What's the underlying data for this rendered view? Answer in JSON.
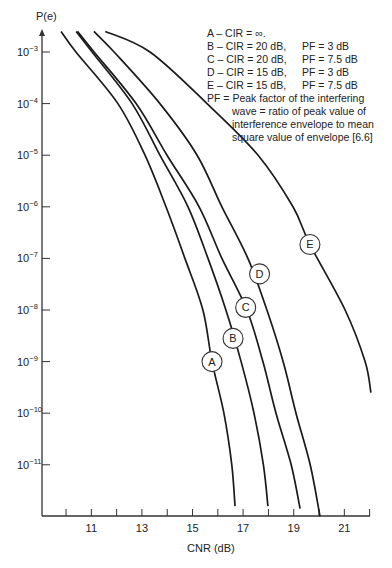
{
  "chart_data": {
    "type": "line",
    "title": "",
    "xlabel": "CNR (dB)",
    "ylabel": "P(e)",
    "y_scale": "log",
    "xlim": [
      9.05,
      22.1
    ],
    "ylim_exponent": [
      -12,
      -2.6
    ],
    "x_ticks": [
      10,
      11,
      12,
      13,
      14,
      15,
      16,
      17,
      18,
      19,
      20,
      21,
      22
    ],
    "x_tick_labels": [
      "11",
      "13",
      "15",
      "17",
      "19",
      "21"
    ],
    "x_tick_label_values": [
      11,
      13,
      15,
      17,
      19,
      21
    ],
    "y_ticks_exponent": [
      -3,
      -4,
      -5,
      -6,
      -7,
      -8,
      -9,
      -10,
      -11
    ],
    "y_tick_labels": [
      "10^-3",
      "10^-4",
      "10^-5",
      "10^-6",
      "10^-7",
      "10^-8",
      "10^-9",
      "10^-10",
      "10^-11"
    ],
    "grid": false,
    "legend_position": "top-right",
    "series": [
      {
        "name": "A",
        "description": "CIR = ∞",
        "points": [
          [
            9.8,
            -2.6
          ],
          [
            10.39,
            -3
          ],
          [
            12.05,
            -4
          ],
          [
            13.12,
            -5
          ],
          [
            13.95,
            -6
          ],
          [
            14.7,
            -7
          ],
          [
            15.41,
            -8
          ],
          [
            15.77,
            -9
          ],
          [
            16.24,
            -10
          ],
          [
            16.55,
            -11
          ],
          [
            16.68,
            -11.8
          ]
        ],
        "label_at": [
          15.77,
          -9.0
        ]
      },
      {
        "name": "B",
        "description": "CIR = 20 dB, PF = 3 dB",
        "points": [
          [
            10.4,
            -2.6
          ],
          [
            11.03,
            -3
          ],
          [
            12.61,
            -4
          ],
          [
            13.71,
            -5
          ],
          [
            14.82,
            -6
          ],
          [
            15.61,
            -7
          ],
          [
            16.32,
            -8
          ],
          [
            16.92,
            -9
          ],
          [
            17.43,
            -10
          ],
          [
            17.8,
            -11
          ],
          [
            17.98,
            -11.8
          ]
        ],
        "label_at": [
          16.6,
          -8.55
        ]
      },
      {
        "name": "C",
        "description": "CIR = 20 dB, PF = 7.5 dB",
        "points": [
          [
            10.45,
            -2.6
          ],
          [
            11.11,
            -3
          ],
          [
            12.77,
            -4
          ],
          [
            13.99,
            -5
          ],
          [
            15.26,
            -6
          ],
          [
            16.16,
            -7
          ],
          [
            17.15,
            -8
          ],
          [
            17.78,
            -9
          ],
          [
            18.3,
            -10
          ],
          [
            18.9,
            -11
          ],
          [
            19.25,
            -11.85
          ]
        ],
        "label_at": [
          17.1,
          -7.95
        ]
      },
      {
        "name": "D",
        "description": "CIR = 15 dB, PF = 3 dB",
        "points": [
          [
            11.1,
            -2.6
          ],
          [
            11.9,
            -3
          ],
          [
            13.71,
            -4
          ],
          [
            15.18,
            -5
          ],
          [
            16.16,
            -6
          ],
          [
            17.19,
            -7
          ],
          [
            17.94,
            -8
          ],
          [
            18.58,
            -9
          ],
          [
            19.09,
            -10
          ],
          [
            19.65,
            -11
          ],
          [
            20.04,
            -12
          ]
        ],
        "label_at": [
          17.65,
          -7.3
        ]
      },
      {
        "name": "E",
        "description": "CIR = 15 dB, PF = 7.5 dB",
        "points": [
          [
            11.55,
            -2.6
          ],
          [
            13.32,
            -3
          ],
          [
            15.57,
            -4
          ],
          [
            17.59,
            -5
          ],
          [
            18.97,
            -6
          ],
          [
            19.64,
            -6.73
          ],
          [
            21.03,
            -8
          ],
          [
            21.82,
            -9
          ],
          [
            22.05,
            -9.6
          ]
        ],
        "label_at": [
          19.64,
          -6.73
        ]
      }
    ],
    "annotations": [
      "A – CIR = ∞",
      "B – CIR = 20 dB, PF = 3 dB",
      "C – CIR = 20 dB, PF = 7.5 dB",
      "D – CIR = 15 dB, PF = 3 dB",
      "E – CIR = 15 dB, PF = 7.5 dB",
      "PF = Peak factor of the interfering wave = ratio of peak value of interference envelope to mean square value of envelope [6.6]"
    ]
  },
  "axes": {
    "y_title": "P(e)",
    "x_title": "CNR (dB)"
  },
  "legend": {
    "rows": [
      {
        "curve": "A",
        "cir": "A – CIR = ∞.",
        "pf": ""
      },
      {
        "curve": "B",
        "cir": "B – CIR = 20 dB,",
        "pf": "PF = 3 dB"
      },
      {
        "curve": "C",
        "cir": "C – CIR = 20 dB,",
        "pf": "PF = 7.5 dB"
      },
      {
        "curve": "D",
        "cir": "D – CIR = 15 dB,",
        "pf": "PF = 3 dB"
      },
      {
        "curve": "E",
        "cir": "E – CIR = 15 dB,",
        "pf": "PF = 7.5 dB"
      }
    ],
    "note_line1": "PF = Peak factor of the interfering",
    "note_line2": "wave = ratio of peak value of",
    "note_line3": "interference envelope to mean",
    "note_line4": "square value of envelope [6.6]"
  }
}
